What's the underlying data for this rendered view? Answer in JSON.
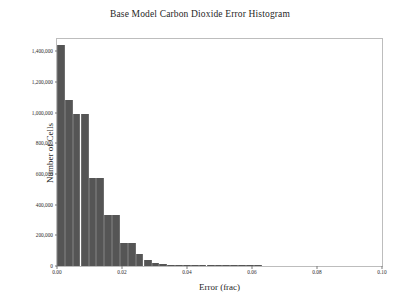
{
  "chart_data": {
    "type": "bar",
    "title": "Base Model Carbon Dioxide Error Histogram",
    "xlabel": "Error (frac)",
    "ylabel": "Number of Cells",
    "xlim": [
      0.0,
      0.1
    ],
    "ylim": [
      0,
      1480000
    ],
    "grid": false,
    "legend": null,
    "bin_width": 0.0024,
    "xtick_labels": [
      "0.00",
      "0.02",
      "0.04",
      "0.06",
      "0.08",
      "0.10"
    ],
    "xtick_values": [
      0.0,
      0.02,
      0.04,
      0.06,
      0.08,
      0.1
    ],
    "ytick_labels": [
      "0",
      "200,000",
      "400,000",
      "600,000",
      "800,000",
      "1,000,000",
      "1,200,000",
      "1,400,000"
    ],
    "ytick_values": [
      0,
      200000,
      400000,
      600000,
      800000,
      1000000,
      1200000,
      1400000
    ],
    "bar_color": "#555555",
    "categories": [
      "0.0000",
      "0.0024",
      "0.0048",
      "0.0073",
      "0.0097",
      "0.0121",
      "0.0145",
      "0.0170",
      "0.0194",
      "0.0218",
      "0.0242",
      "0.0267",
      "0.0291",
      "0.0315",
      "0.0339",
      "0.0364",
      "0.0388",
      "0.0412",
      "0.0436",
      "0.0461",
      "0.0485",
      "0.0509",
      "0.0533",
      "0.0558",
      "0.0582",
      "0.0606"
    ],
    "values": [
      1440000,
      1085000,
      990000,
      990000,
      575000,
      575000,
      330000,
      330000,
      150000,
      150000,
      78000,
      40000,
      22000,
      14000,
      9000,
      6000,
      4200,
      3000,
      2200,
      1600,
      1200,
      900,
      700,
      500,
      350,
      220
    ]
  }
}
